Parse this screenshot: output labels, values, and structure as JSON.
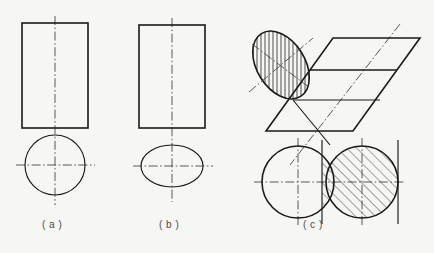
{
  "figure": {
    "background_color": "#f6f6f4",
    "line_color": "#1a1a1a",
    "centerline_color": "#3c3c3c",
    "width": 434,
    "height": 253,
    "captions": [
      {
        "id": "a",
        "label": "( a )",
        "x": 42,
        "y": 219
      },
      {
        "id": "b",
        "label": "( b )",
        "x": 159,
        "y": 219
      },
      {
        "id": "c",
        "label": "( c )",
        "x": 303,
        "y": 219
      }
    ],
    "parts": [
      {
        "id": "a",
        "name": "cylinder-upright-views",
        "description": "Front view rectangle above a top view circle with crossing centre lines",
        "shapes": [
          {
            "type": "rect",
            "name": "front-view-rectangle",
            "x": 22,
            "y": 23,
            "width": 66,
            "height": 105
          },
          {
            "type": "circle",
            "name": "top-view-circle",
            "cx": 55,
            "cy": 165,
            "r": 30
          },
          {
            "type": "centerline-vertical",
            "x": 55,
            "y1": 16,
            "y2": 205
          },
          {
            "type": "centerline-horizontal",
            "y": 165,
            "x1": 16,
            "x2": 95
          }
        ]
      },
      {
        "id": "b",
        "name": "cylinder-oblique-views",
        "description": "Front view rectangle above a top view ellipse with crossing centre lines",
        "shapes": [
          {
            "type": "rect",
            "name": "front-view-rectangle",
            "x": 139,
            "y": 25,
            "width": 66,
            "height": 103
          },
          {
            "type": "ellipse",
            "name": "top-view-ellipse",
            "cx": 172,
            "cy": 166,
            "rx": 31,
            "ry": 21
          },
          {
            "type": "centerline-vertical",
            "x": 172,
            "y1": 18,
            "y2": 202
          },
          {
            "type": "centerline-horizontal",
            "y": 166,
            "x1": 133,
            "x2": 213
          }
        ]
      },
      {
        "id": "c",
        "name": "oblique-cut-cylinder-pictorial",
        "description": "Hatched tilted ellipse, a parallelogram pictorial face and two overlapping circles with a hatched overlap band",
        "shapes": [
          {
            "type": "ellipse-hatched",
            "name": "section-ellipse",
            "cx": 281,
            "cy": 65,
            "rx": 24,
            "ry": 37,
            "rotation": -32,
            "hatch": "vertical"
          },
          {
            "type": "parallelogram",
            "name": "pictorial-parallelogram",
            "points": "333,38 420,38 353,131 266,131"
          },
          {
            "type": "parallelogram-internal-line",
            "name": "parallelogram-upper-divider",
            "points": "310,70 397,70"
          },
          {
            "type": "parallelogram-internal-line",
            "name": "parallelogram-lower-edge",
            "points": "293,100 330,145"
          },
          {
            "type": "centerline-oblique",
            "name": "ellipse-major-axis",
            "x1": 249,
            "y1": 92,
            "x2": 313,
            "y2": 38
          },
          {
            "type": "centerline-oblique",
            "name": "ellipse-minor-axis",
            "x1": 252,
            "y1": 44,
            "x2": 310,
            "y2": 88
          },
          {
            "type": "centerline-oblique",
            "name": "pictorial-axis",
            "x1": 400,
            "y1": 24,
            "x2": 290,
            "y2": 165
          },
          {
            "type": "circle",
            "name": "bottom-left-circle",
            "cx": 298,
            "cy": 182,
            "r": 36
          },
          {
            "type": "circle",
            "name": "bottom-right-circle",
            "cx": 362,
            "cy": 182,
            "r": 36
          },
          {
            "type": "hatched-band",
            "name": "overlap-hatch-region",
            "x1": 322,
            "x2": 398,
            "hatch": "diagonal-45"
          },
          {
            "type": "centerline-horizontal",
            "y": 182,
            "x1": 254,
            "x2": 406
          },
          {
            "type": "centerline-vertical",
            "x": 298,
            "y1": 138,
            "y2": 226
          },
          {
            "type": "centerline-vertical",
            "x": 362,
            "y1": 138,
            "y2": 226
          },
          {
            "type": "centerline-vertical",
            "x": 322,
            "y1": 140,
            "y2": 224
          },
          {
            "type": "centerline-vertical",
            "x": 398,
            "y1": 140,
            "y2": 224
          }
        ]
      }
    ]
  }
}
